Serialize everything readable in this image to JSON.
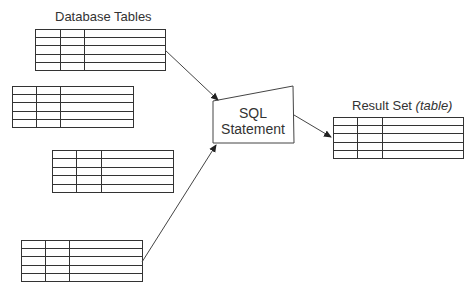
{
  "labels": {
    "source": "Database Tables",
    "result_main": "Result Set ",
    "result_italic": "(table)",
    "sql_line1": "SQL",
    "sql_line2": "Statement"
  },
  "diagram": {
    "source_tables": [
      {
        "name": "database-table-1",
        "rows": 5,
        "columns": 3
      },
      {
        "name": "database-table-2",
        "rows": 5,
        "columns": 3
      },
      {
        "name": "database-table-3",
        "rows": 5,
        "columns": 3
      },
      {
        "name": "database-table-4",
        "rows": 5,
        "columns": 3
      }
    ],
    "result_table": {
      "name": "result-table",
      "rows": 5,
      "columns": 3
    },
    "edges": [
      {
        "from": "database-table-1",
        "to": "sql-statement"
      },
      {
        "from": "database-table-4",
        "to": "sql-statement"
      },
      {
        "from": "sql-statement",
        "to": "result-table"
      }
    ],
    "line_color": "#333333"
  }
}
